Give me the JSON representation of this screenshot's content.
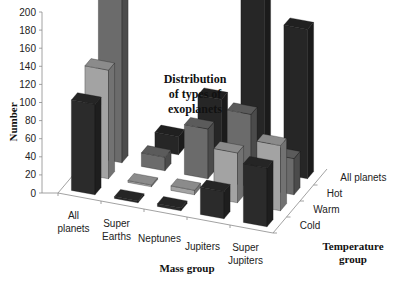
{
  "chart_data": {
    "type": "bar",
    "variant": "3d-grouped",
    "title": "Distribution of types of exoplanets",
    "title_lines": [
      "Distribution",
      "of types of",
      "exoplanets"
    ],
    "xlabel": "Mass group",
    "ylabel": "Number",
    "zlabel": "Temperature group",
    "zlabel_lines": [
      "Temperature",
      "group"
    ],
    "ylim": [
      0,
      200
    ],
    "yticks": [
      0,
      20,
      40,
      60,
      80,
      100,
      120,
      140,
      160,
      180,
      200
    ],
    "categories": [
      "All planets",
      "Super Earths",
      "Neptunes",
      "Jupiters",
      "Super Jupiters"
    ],
    "category_lines": [
      [
        "All",
        "planets"
      ],
      [
        "Super",
        "Earths"
      ],
      [
        "Neptunes"
      ],
      [
        "Jupiters"
      ],
      [
        "Super",
        "Jupiters"
      ]
    ],
    "series": [
      {
        "name": "Cold",
        "color": "#2b2b2b",
        "values": [
          100,
          2,
          3,
          30,
          65
        ]
      },
      {
        "name": "Warm",
        "color": "#a3a3a3",
        "values": [
          120,
          2,
          5,
          55,
          72
        ]
      },
      {
        "name": "Hot",
        "color": "#6b6b6b",
        "values": [
          190,
          15,
          55,
          80,
          40
        ]
      },
      {
        "name": "All planets",
        "color": "#262626",
        "values": [
          0,
          20,
          70,
          195,
          165
        ]
      }
    ]
  }
}
